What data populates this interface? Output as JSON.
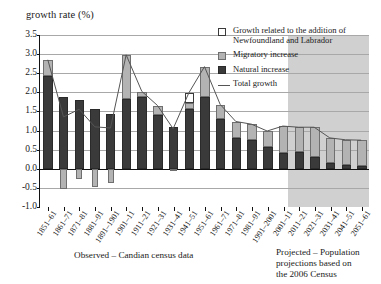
{
  "chart_data": {
    "type": "bar",
    "title": "growth rate (%)",
    "ylabel": "growth rate (%)",
    "xlabel": "",
    "ylim": [
      -1.0,
      3.5
    ],
    "ytick_labels": [
      "3.5",
      "3.0",
      "2.5",
      "2.0",
      "1.5",
      "1.0",
      "0.5",
      "0.0",
      "-0.5",
      "-1.0"
    ],
    "ytick_values": [
      3.5,
      3.0,
      2.5,
      2.0,
      1.5,
      1.0,
      0.5,
      0.0,
      -0.5,
      -1.0
    ],
    "grid": true,
    "stacked": true,
    "legend_position": "top-right",
    "categories": [
      "1851–61",
      "1861–71",
      "1871–81",
      "1881–91",
      "1891–1901",
      "1901–11",
      "1911–21",
      "1921–31",
      "1931–41",
      "1941–51",
      "1951–61",
      "1961–71",
      "1971–81",
      "1981–91",
      "1991–2001",
      "2001–11",
      "2011–21",
      "2021–31",
      "2031–41",
      "2041–51",
      "2051–61"
    ],
    "series": [
      {
        "name": "Natural increase",
        "color": "#3a3a3a",
        "values": [
          2.44,
          1.89,
          1.81,
          1.57,
          1.43,
          1.82,
          1.88,
          1.4,
          1.1,
          1.56,
          1.88,
          1.3,
          0.8,
          0.75,
          0.56,
          0.42,
          0.43,
          0.31,
          0.14,
          0.09,
          0.08
        ]
      },
      {
        "name": "Migratory increase",
        "color": "#b3b3b3",
        "values": [
          0.41,
          -0.54,
          -0.26,
          -0.48,
          -0.37,
          1.16,
          0.14,
          0.25,
          -0.06,
          0.17,
          0.79,
          0.38,
          0.43,
          0.41,
          0.42,
          0.69,
          0.65,
          0.77,
          0.66,
          0.66,
          0.66
        ]
      },
      {
        "name": "Growth related to the addition of Newfoundland and Labrador",
        "color": "#ffffff",
        "values": [
          0,
          0,
          0,
          0,
          0,
          0,
          0,
          0,
          0,
          0.25,
          0,
          0,
          0,
          0,
          0,
          0,
          0,
          0,
          0,
          0,
          0
        ]
      }
    ],
    "line_series": {
      "name": "Total growth",
      "color": "#555555",
      "values": [
        2.85,
        1.35,
        1.55,
        1.09,
        1.06,
        2.98,
        2.02,
        1.65,
        1.04,
        1.98,
        2.67,
        1.68,
        1.23,
        1.16,
        0.98,
        1.11,
        1.08,
        1.08,
        0.8,
        0.75,
        0.74
      ]
    },
    "annotations": {
      "observed_caption": "Observed – Candian census data",
      "projected_caption": "Projected – Population projections based on the 2006 Census",
      "projection_start_category": "2001–11"
    }
  },
  "legend": {
    "items": [
      {
        "key": "newfoundland-swatch",
        "label": "Growth related to the addition of Newfoundland and Labrador"
      },
      {
        "key": "migratory-swatch",
        "label": "Migratory increase"
      },
      {
        "key": "natural-swatch",
        "label": "Natural increase"
      },
      {
        "key": "total-line-swatch",
        "label": "Total growth"
      }
    ]
  },
  "captions": {
    "observed": "Observed – Candian census data",
    "projected_line1": "Projected – Population",
    "projected_line2": "projections based on",
    "projected_line3": "the 2006 Census"
  },
  "colors": {
    "natural": "#3a3a3a",
    "migratory": "#b3b3b3",
    "newfoundland": "#ffffff",
    "line": "#555555",
    "projection_shade": "#d0d0d0",
    "grid": "#a8a8a8",
    "axis": "#111111"
  }
}
